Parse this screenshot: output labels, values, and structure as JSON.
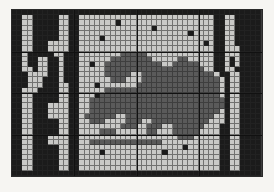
{
  "image": {
    "title": "Cross-stitch mosaic grid pattern",
    "subject": "stylized dragon motif with ornamental border",
    "width_px": 274,
    "height_px": 192,
    "background_color": "#f6f5f2"
  },
  "grid": {
    "columns": 48,
    "rows": 32,
    "cell_size_px": 5.2,
    "origin_x_px": 12,
    "origin_y_px": 10,
    "gridline_color": "#282828",
    "outline_color": "#2a2a2a",
    "guide_line_color": "#111111",
    "guide_columns": [
      12,
      24,
      36
    ],
    "guide_rows": [
      8,
      16,
      24
    ]
  },
  "palette": {
    "light": "#c9c9c7",
    "medium": "#5a5a5a",
    "dark": "#1b1b1b",
    "legend": [
      {
        "key": "L",
        "name": "light-gray",
        "hex": "#c9c9c7"
      },
      {
        "key": "M",
        "name": "medium-gray",
        "hex": "#5a5a5a"
      },
      {
        "key": "D",
        "name": "dark-black",
        "hex": "#1b1b1b"
      }
    ]
  },
  "chart_data": {
    "type": "heatmap",
    "xlabel": "",
    "ylabel": "",
    "categories": [],
    "values": [],
    "rows": [
      "DDDDDDDDDDDDDDDDDDDDDDDDDDDDDDDDDDDDDDDDDDDDDDDD",
      "DDLLDDDDDLLDDLLLLLLLLLLLLLLLLLLLLLLLLLLDDLLDDDDD",
      "DDLLDDDDDLLDDLLLLLLLDLLLLLLLLLLLLLLLLLLDDLLDDDDD",
      "DDLLDDDDDLLDDLLLLLLLLLLLLLLDLLLLLLLLLLLDDLLDDDDD",
      "DDLLDDDDDLLDDLLLLLLLLLLLLLLLLLLLLLDLLLLDDLLDDDDD",
      "DDLLDDDDDLLDDLLLLDLLLLLLLLLLLLLLLLLLLLLDDLLDDDDD",
      "DDLLDDDLLLLDDLLLLLLLLLLLLLLLLLLLLLLLLDLDDLLDDDDD",
      "DDLLDDDLLLLDDLLLLLLLLLLLLLLLLLLLLLLLLLLDDLLLDDDD",
      "DDLDDDDDLLDDDLLLLLLLLMMMMMLLLLLLLLLLLLLDDLLLDDDD",
      "DDLDDLLDDLDDDLLLLLLMMMMMMMMLLLLLMMLLLLLDDLDLDDDD",
      "DDLDDLLDDLDDDLLDLLMMMMMMMMMMMLLMMMMMLLLDDLDLDDDD",
      "DDLLDLLDDLDDDLLLLLMMMMMMMMMMMMMMMMMMMLLDDLLDDDDD",
      "DDDLLLLDDLDDDLLLLLMMMMMLLMMMMMMMMMMMMMMLDDLLDDDD",
      "DDDLLLDDDLDDDLLLLLLMMMLLLMMMMMMMMMMMMMMMLDLLDDDD",
      "DDDLLLDDDLLDDLLLDLLLLLLLMMMMMMMMMMMMMMMMLDLLDDDD",
      "DDLLLDDDDLLDDLLLLLMMMMMMMMMMMMMMMMMMMMMMLDLLDDDD",
      "DDLLDDDDDLLDDLLLDMMMMMMMMMMMMMMMMMMMMMMMLDLLDDDD",
      "DDLLDDDDDLLDDLLMMMMMMMMMMMMMMMMMMMMMMMMMMDLLDDDD",
      "DDLLDDDLLLLDDLLMMMMMMMMMMMMMMMMMMMMMMMMMMDLLDDDD",
      "DDLLDDDLLLLDDLLMMMMMMMMMMMMMMMMMMMMMMMMMLDLLDDDD",
      "DDLLDDDLLLLDDLMMMMMMLLMMMMMMMMMMMMMMMMMLLDLLDDDD",
      "DDLLDDDDDLLDDLLMMMLLLLMMMLLMMMMMMMMMMMLLLDLLDDDD",
      "DDLLDDDDDLLDDLLLLLLLLMMMLLMMMLLMMMMMMLLLDDLLDDDD",
      "DDLLDDDDDLLDDLLLLMMMLLLLLLMMLLLMMMMMLLLLDDLLDDDD",
      "DDLLDDDLLLLDDLLLLLLLLLLLLLLLLLLLMMMLLLLLDDLLDDDD",
      "DDLLDDDLLLLDDLLMMMMMMMMMMMMMMLLLLLLLLLLLDDLLDDDD",
      "DDLLDDDDDLLDDLLLLLLLLLLLLLLLLLLLLDLLLLLLDDLLDDDD",
      "DDLLDDDDDLLDDLLLLDLLLLLLLLLLLDLLLLLLLLLLDDLLDDDD",
      "DDLLDDDDDLLDDLLLLLLLLLLLLLLLLLLLLLLLLLLLDDLLDDDD",
      "DDLLDDDDDLLDDLLLLLLLLLLLLLLLLLLLLLLLLLLLDDLLDDDD",
      "DDLLDDDDDLLDDLLLLLLLLLLLLLLLLLLLLLLLLLLLDDLLDDDD",
      "DDDDDDDDDDDDDDDDDDDDDDDDDDDDDDDDDDDDDDDDDDDDDDDD"
    ]
  }
}
